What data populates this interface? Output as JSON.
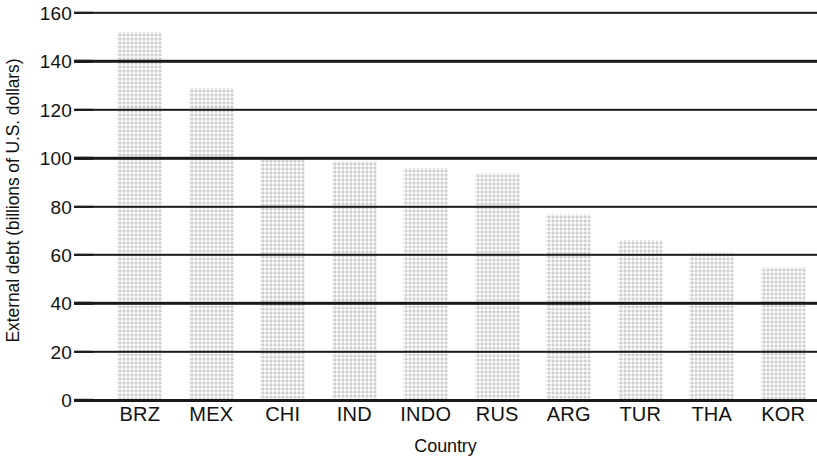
{
  "chart_data": {
    "type": "bar",
    "title": "",
    "xlabel": "Country",
    "ylabel": "External debt (billions of U.S. dollars)",
    "categories": [
      "BRZ",
      "MEX",
      "CHI",
      "IND",
      "INDO",
      "RUS",
      "ARG",
      "TUR",
      "THA",
      "KOR"
    ],
    "values": [
      152,
      129,
      100,
      99,
      96,
      94,
      77,
      66,
      61,
      55
    ],
    "ylim": [
      0,
      160
    ],
    "ytick_values": [
      0,
      20,
      40,
      60,
      80,
      100,
      120,
      140,
      160
    ],
    "ytick_labels": [
      "0",
      "20",
      "40",
      "60",
      "80",
      "100",
      "120",
      "140",
      "160"
    ],
    "grid": true,
    "grid_axis": "y",
    "legend": false,
    "legend_position": "none",
    "bar_color": "#e9e9e9",
    "axis_color": "#1a1a1a",
    "text_color": "#111111",
    "background_color": "#ffffff"
  }
}
